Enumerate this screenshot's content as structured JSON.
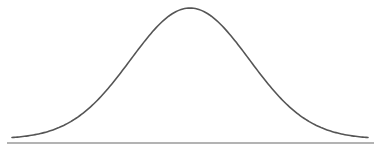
{
  "chart_data": {
    "type": "line",
    "title": "",
    "xlabel": "",
    "ylabel": "",
    "x": [
      -3.0,
      -2.5,
      -2.0,
      -1.5,
      -1.0,
      -0.5,
      0.0,
      0.5,
      1.0,
      1.5,
      2.0,
      2.5,
      3.0
    ],
    "series": [
      {
        "name": "density",
        "values": [
          0.004,
          0.018,
          0.054,
          0.13,
          0.242,
          0.352,
          0.399,
          0.352,
          0.242,
          0.13,
          0.054,
          0.018,
          0.004
        ]
      }
    ],
    "xlim": [
      -3.0,
      3.0
    ],
    "ylim": [
      0,
      0.4
    ],
    "grid": false,
    "legend": "none"
  },
  "style": {
    "curve_color": "#555555",
    "baseline_color": "#9a9a9a",
    "background": "#ffffff"
  }
}
